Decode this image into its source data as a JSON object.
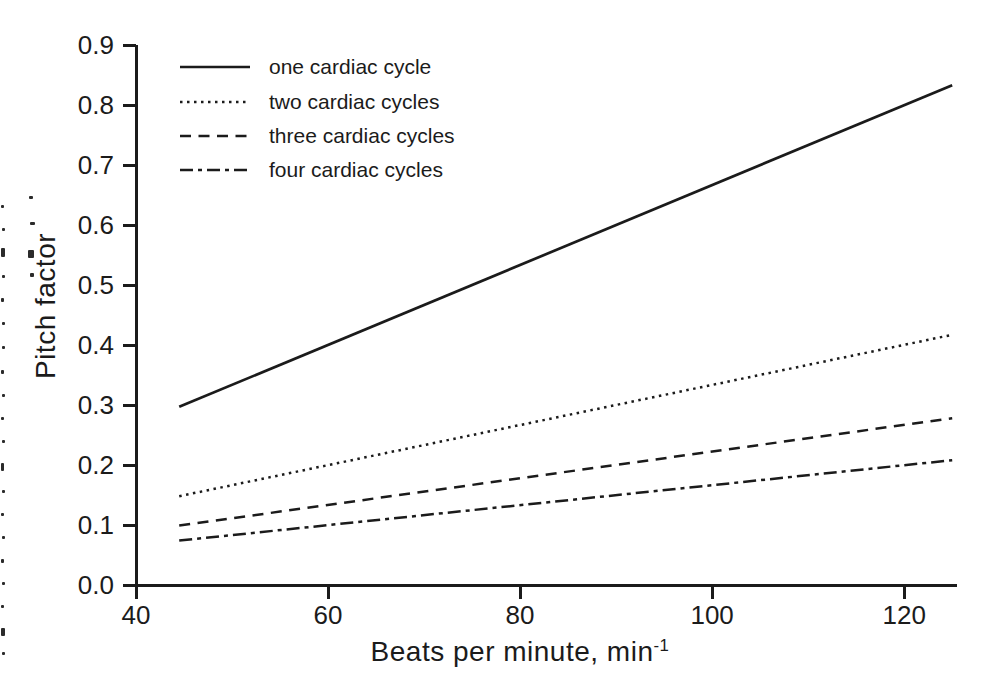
{
  "chart_data": {
    "type": "line",
    "title": "",
    "xlabel": "Beats per minute, min",
    "xlabel_superscript": "-1",
    "ylabel": "Pitch factor",
    "xlim": [
      40,
      125.5
    ],
    "ylim": [
      0.0,
      0.9
    ],
    "x_tick_labels": [
      "40",
      "60",
      "80",
      "100",
      "120"
    ],
    "x_tick_values": [
      40,
      60,
      80,
      100,
      120
    ],
    "y_tick_labels": [
      "0.0",
      "0.1",
      "0.2",
      "0.3",
      "0.4",
      "0.5",
      "0.6",
      "0.7",
      "0.8",
      "0.9"
    ],
    "y_tick_values": [
      0.0,
      0.1,
      0.2,
      0.3,
      0.4,
      0.5,
      0.6,
      0.7,
      0.8,
      0.9
    ],
    "grid": false,
    "legend_position": "top-left",
    "x": [
      44.5,
      125
    ],
    "series": [
      {
        "name": "one cardiac cycle",
        "style": "solid",
        "values": [
          0.297,
          0.833
        ]
      },
      {
        "name": "two cardiac cycles",
        "style": "dotted",
        "values": [
          0.148,
          0.417
        ]
      },
      {
        "name": "three cardiac cycles",
        "style": "dashed",
        "values": [
          0.099,
          0.278
        ]
      },
      {
        "name": "four cardiac cycles",
        "style": "dashdot",
        "values": [
          0.074,
          0.208
        ]
      }
    ],
    "ink_color": "#1b1b1b",
    "background_color": "#ffffff"
  }
}
